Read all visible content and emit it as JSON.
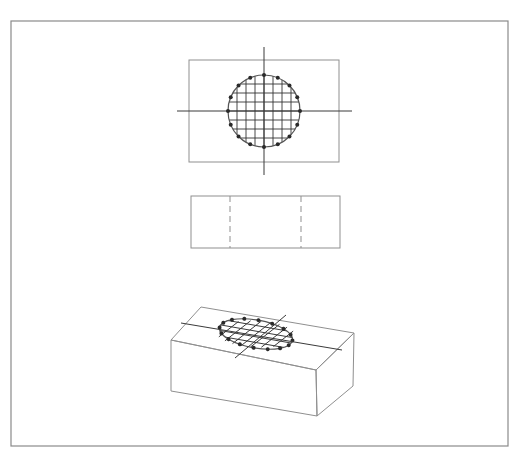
{
  "figure": {
    "title": "Orthographic and isometric projections of a block with a circular grid region",
    "frame": {
      "x": 11,
      "y": 21,
      "width": 497,
      "height": 425
    },
    "colors": {
      "line": "#8f8f8f",
      "axis": "#3a3a3a",
      "grid": "#333333",
      "dot": "#2a2a2a",
      "background": "#ffffff"
    },
    "views": [
      {
        "name": "top-view",
        "rect": {
          "x": 189,
          "y": 60,
          "width": 150,
          "height": 102
        },
        "center": [
          264,
          111
        ],
        "radius": 36,
        "h_axis": [
          177,
          352
        ],
        "v_axis": [
          47,
          175
        ],
        "grid_lines": 7,
        "perimeter_points": 16
      },
      {
        "name": "front-view",
        "rect": {
          "x": 191,
          "y": 196,
          "width": 149,
          "height": 52
        },
        "hidden_lines_x": [
          230,
          301
        ]
      },
      {
        "name": "isometric-view",
        "box": {
          "top": [
            [
              201,
              307
            ],
            [
              354,
              333
            ],
            [
              316,
              370
            ],
            [
              171,
              340
            ]
          ],
          "front_left_bottom": [
            171,
            391
          ],
          "front_right_bottom": [
            317,
            416
          ],
          "back_right_bottom": [
            353,
            386
          ]
        },
        "ellipse": {
          "cx": 256,
          "cy": 334,
          "rx": 37,
          "ry": 14,
          "rotation": 10
        },
        "h_axis": [
          [
            181,
            323
          ],
          [
            342,
            350
          ]
        ],
        "v_axis": [
          [
            286,
            315
          ],
          [
            235,
            358
          ]
        ],
        "perimeter_points": 16
      }
    ]
  }
}
